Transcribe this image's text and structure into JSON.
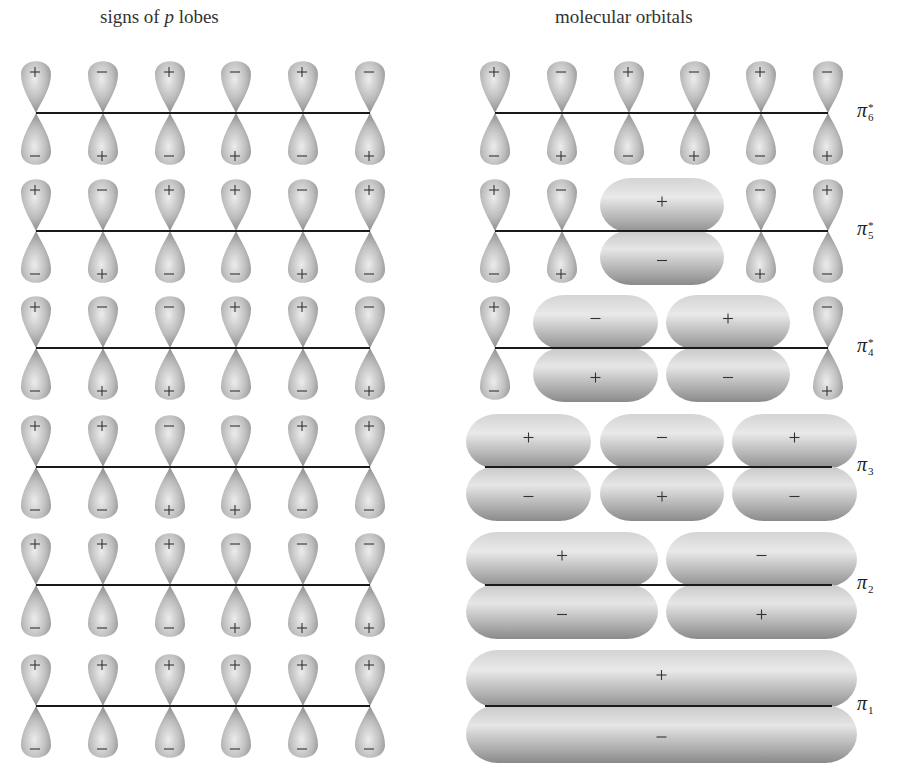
{
  "titles": {
    "left_prefix": "signs of ",
    "left_italic": "p",
    "left_suffix": " lobes",
    "right": "molecular orbitals"
  },
  "colors": {
    "background": "#ffffff",
    "lobe_light": "#e6e6e6",
    "lobe_mid": "#b9b9b9",
    "lobe_dark": "#8a8a8a",
    "axis_line": "#1a1a1a",
    "text": "#222222"
  },
  "atoms": 6,
  "rows": [
    {
      "label": "π",
      "sub": "6",
      "star": true,
      "label_text": "π6*",
      "top_signs": [
        "+",
        "−",
        "+",
        "−",
        "+",
        "−"
      ],
      "bottom_signs": [
        "−",
        "+",
        "−",
        "+",
        "−",
        "+"
      ],
      "mo_top": [
        {
          "span": [
            0,
            0
          ],
          "sign": "+"
        },
        {
          "span": [
            1,
            1
          ],
          "sign": "−"
        },
        {
          "span": [
            2,
            2
          ],
          "sign": "+"
        },
        {
          "span": [
            3,
            3
          ],
          "sign": "−"
        },
        {
          "span": [
            4,
            4
          ],
          "sign": "+"
        },
        {
          "span": [
            5,
            5
          ],
          "sign": "−"
        }
      ],
      "mo_bottom": [
        {
          "span": [
            0,
            0
          ],
          "sign": "−"
        },
        {
          "span": [
            1,
            1
          ],
          "sign": "+"
        },
        {
          "span": [
            2,
            2
          ],
          "sign": "−"
        },
        {
          "span": [
            3,
            3
          ],
          "sign": "+"
        },
        {
          "span": [
            4,
            4
          ],
          "sign": "−"
        },
        {
          "span": [
            5,
            5
          ],
          "sign": "+"
        }
      ]
    },
    {
      "label": "π",
      "sub": "5",
      "star": true,
      "label_text": "π5*",
      "top_signs": [
        "+",
        "−",
        "+",
        "+",
        "−",
        "+"
      ],
      "bottom_signs": [
        "−",
        "+",
        "−",
        "−",
        "+",
        "−"
      ],
      "mo_top": [
        {
          "span": [
            0,
            0
          ],
          "sign": "+"
        },
        {
          "span": [
            1,
            1
          ],
          "sign": "−"
        },
        {
          "span": [
            2,
            3
          ],
          "sign": "+"
        },
        {
          "span": [
            4,
            4
          ],
          "sign": "−"
        },
        {
          "span": [
            5,
            5
          ],
          "sign": "+"
        }
      ],
      "mo_bottom": [
        {
          "span": [
            0,
            0
          ],
          "sign": "−"
        },
        {
          "span": [
            1,
            1
          ],
          "sign": "+"
        },
        {
          "span": [
            2,
            3
          ],
          "sign": "−"
        },
        {
          "span": [
            4,
            4
          ],
          "sign": "+"
        },
        {
          "span": [
            5,
            5
          ],
          "sign": "−"
        }
      ]
    },
    {
      "label": "π",
      "sub": "4",
      "star": true,
      "label_text": "π4*",
      "top_signs": [
        "+",
        "−",
        "−",
        "+",
        "+",
        "−"
      ],
      "bottom_signs": [
        "−",
        "+",
        "+",
        "−",
        "−",
        "+"
      ],
      "mo_top": [
        {
          "span": [
            0,
            0
          ],
          "sign": "+"
        },
        {
          "span": [
            1,
            2
          ],
          "sign": "−"
        },
        {
          "span": [
            3,
            4
          ],
          "sign": "+"
        },
        {
          "span": [
            5,
            5
          ],
          "sign": "−"
        }
      ],
      "mo_bottom": [
        {
          "span": [
            0,
            0
          ],
          "sign": "−"
        },
        {
          "span": [
            1,
            2
          ],
          "sign": "+"
        },
        {
          "span": [
            3,
            4
          ],
          "sign": "−"
        },
        {
          "span": [
            5,
            5
          ],
          "sign": "+"
        }
      ]
    },
    {
      "label": "π",
      "sub": "3",
      "star": false,
      "label_text": "π3",
      "top_signs": [
        "+",
        "+",
        "−",
        "−",
        "+",
        "+"
      ],
      "bottom_signs": [
        "−",
        "−",
        "+",
        "+",
        "−",
        "−"
      ],
      "mo_top": [
        {
          "span": [
            0,
            1
          ],
          "sign": "+"
        },
        {
          "span": [
            2,
            3
          ],
          "sign": "−"
        },
        {
          "span": [
            4,
            5
          ],
          "sign": "+"
        }
      ],
      "mo_bottom": [
        {
          "span": [
            0,
            1
          ],
          "sign": "−"
        },
        {
          "span": [
            2,
            3
          ],
          "sign": "+"
        },
        {
          "span": [
            4,
            5
          ],
          "sign": "−"
        }
      ]
    },
    {
      "label": "π",
      "sub": "2",
      "star": false,
      "label_text": "π2",
      "top_signs": [
        "+",
        "+",
        "+",
        "−",
        "−",
        "−"
      ],
      "bottom_signs": [
        "−",
        "−",
        "−",
        "+",
        "+",
        "+"
      ],
      "mo_top": [
        {
          "span": [
            0,
            2
          ],
          "sign": "+"
        },
        {
          "span": [
            3,
            5
          ],
          "sign": "−"
        }
      ],
      "mo_bottom": [
        {
          "span": [
            0,
            2
          ],
          "sign": "−"
        },
        {
          "span": [
            3,
            5
          ],
          "sign": "+"
        }
      ]
    },
    {
      "label": "π",
      "sub": "1",
      "star": false,
      "label_text": "π1",
      "top_signs": [
        "+",
        "+",
        "+",
        "+",
        "+",
        "+"
      ],
      "bottom_signs": [
        "−",
        "−",
        "−",
        "−",
        "−",
        "−"
      ],
      "mo_top": [
        {
          "span": [
            0,
            5
          ],
          "sign": "+"
        }
      ],
      "mo_bottom": [
        {
          "span": [
            0,
            5
          ],
          "sign": "−"
        }
      ]
    }
  ]
}
